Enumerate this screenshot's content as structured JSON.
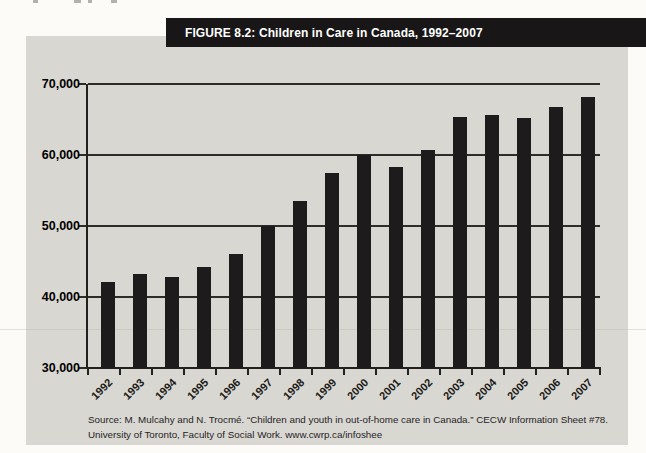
{
  "figure": {
    "title": "FIGURE 8.2: Children in Care in Canada, 1992–2007",
    "title_bar_color": "#181616",
    "panel_color": "#d9d7d2"
  },
  "chart_data": {
    "type": "bar",
    "title": "FIGURE 8.2: Children in Care in Canada, 1992–2007",
    "categories": [
      "1992",
      "1993",
      "1994",
      "1995",
      "1996",
      "1997",
      "1998",
      "1999",
      "2000",
      "2001",
      "2002",
      "2003",
      "2004",
      "2005",
      "2006",
      "2007"
    ],
    "values": [
      42100,
      43300,
      42800,
      44200,
      46100,
      50000,
      53500,
      57400,
      60000,
      58300,
      60700,
      65400,
      65700,
      65200,
      66800,
      68200
    ],
    "ylim": [
      30000,
      70000
    ],
    "yticks": [
      70000,
      60000,
      50000,
      40000,
      30000
    ],
    "ytick_labels": [
      "70,000",
      "60,000",
      "50,000",
      "40,000",
      "30,000"
    ],
    "grid": true,
    "legend_position": "none",
    "bar_color": "#1d1b1c",
    "xlabel": "",
    "ylabel": ""
  },
  "source": {
    "line1": "Source: M. Mulcahy and N. Trocmé. “Children and youth in out-of-home care in Canada.” CECW Information Sheet #78.",
    "line2": "University of Toronto, Faculty of Social Work. www.cwrp.ca/infoshee"
  }
}
